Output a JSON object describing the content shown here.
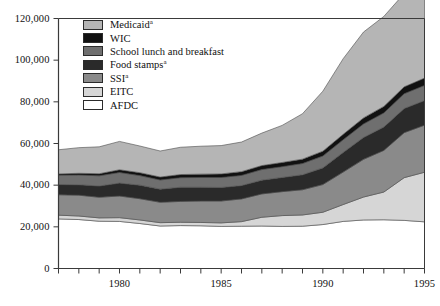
{
  "chart_data": {
    "type": "area",
    "stacked": true,
    "title": "",
    "subtitle": "",
    "xlabel": "",
    "ylabel": "",
    "xlim": [
      1977,
      1995
    ],
    "ylim": [
      0,
      120000
    ],
    "yticks": [
      0,
      20000,
      40000,
      60000,
      80000,
      100000,
      120000
    ],
    "ytick_labels": [
      "0",
      "20,000",
      "40,000",
      "60,000",
      "80,000",
      "100,000",
      "120,000"
    ],
    "xticks": [
      1977,
      1978,
      1979,
      1980,
      1981,
      1982,
      1983,
      1984,
      1985,
      1986,
      1987,
      1988,
      1989,
      1990,
      1991,
      1992,
      1993,
      1994,
      1995
    ],
    "xtick_labels": [
      "1980",
      "1985",
      "1990",
      "1995"
    ],
    "xtick_label_years": [
      1980,
      1985,
      1990,
      1995
    ],
    "grid": false,
    "legend_position": "upper-left",
    "x": [
      1977,
      1978,
      1979,
      1980,
      1981,
      1982,
      1983,
      1984,
      1985,
      1986,
      1987,
      1988,
      1989,
      1990,
      1991,
      1992,
      1993,
      1994,
      1995
    ],
    "stack_order_bottom_to_top": [
      "AFDC",
      "EITC",
      "SSI",
      "Food stamps",
      "School lunch and breakfast",
      "WIC",
      "Medicaid"
    ],
    "series": [
      {
        "name": "AFDC",
        "color": "#ffffff",
        "values": [
          23800,
          23500,
          22700,
          22600,
          21600,
          20400,
          20600,
          20500,
          20200,
          20300,
          20400,
          20200,
          20300,
          21100,
          22600,
          23300,
          23400,
          23100,
          22400
        ]
      },
      {
        "name": "EITC",
        "color": "#d6d6d6",
        "values": [
          1800,
          1700,
          1600,
          1800,
          1700,
          1600,
          1600,
          1600,
          1700,
          2200,
          4200,
          5200,
          5400,
          5900,
          8100,
          11000,
          13300,
          20500,
          23800
        ]
      },
      {
        "name": "SSI",
        "color": "#8a8a8a",
        "values": [
          9800,
          10000,
          9900,
          10400,
          10200,
          9800,
          10000,
          10300,
          10500,
          10900,
          11200,
          11500,
          12100,
          13300,
          15600,
          18100,
          20000,
          21600,
          22600
        ]
      },
      {
        "name": "Food stamps",
        "color": "#2a2a2a",
        "values": [
          4900,
          5000,
          5400,
          6200,
          6500,
          6300,
          6800,
          6600,
          6500,
          6400,
          6600,
          6800,
          7200,
          8000,
          9400,
          10500,
          11200,
          11600,
          11800
        ]
      },
      {
        "name": "School lunch and breakfast",
        "color": "#6f6f6f",
        "values": [
          4500,
          4700,
          4900,
          5100,
          4600,
          4400,
          4600,
          4700,
          4800,
          4900,
          5100,
          5200,
          5400,
          5700,
          6100,
          6500,
          6800,
          7100,
          7300
        ]
      },
      {
        "name": "WIC",
        "color": "#111111",
        "values": [
          600,
          800,
          1000,
          1300,
          1400,
          1400,
          1500,
          1600,
          1700,
          1800,
          1900,
          2000,
          2100,
          2300,
          2600,
          2900,
          3100,
          3300,
          3500
        ]
      },
      {
        "name": "Medicaid",
        "color": "#b5b5b5",
        "values": [
          11600,
          12300,
          12900,
          13600,
          12800,
          12500,
          13100,
          13400,
          13600,
          14200,
          15600,
          17800,
          21800,
          28800,
          36300,
          41200,
          43200,
          44800,
          46100
        ]
      }
    ],
    "legend_entries": [
      {
        "label": "Medicaid",
        "footnote": "a",
        "color": "#b5b5b5"
      },
      {
        "label": "WIC",
        "footnote": "",
        "color": "#111111"
      },
      {
        "label": "School lunch and breakfast",
        "footnote": "",
        "color": "#6f6f6f"
      },
      {
        "label": "Food stamps",
        "footnote": "a",
        "color": "#2a2a2a"
      },
      {
        "label": "SSI",
        "footnote": "a",
        "color": "#8a8a8a"
      },
      {
        "label": "EITC",
        "footnote": "",
        "color": "#d6d6d6"
      },
      {
        "label": "AFDC",
        "footnote": "",
        "color": "#ffffff"
      }
    ]
  },
  "axes": {
    "frame_color": "#3a3a3a",
    "tick_color": "#3a3a3a"
  }
}
